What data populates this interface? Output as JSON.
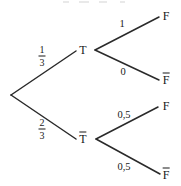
{
  "diagram": {
    "type": "probability-tree",
    "title": "",
    "width": 181,
    "height": 186,
    "line_color": "#2a2a2a",
    "text_color": "#181818"
  },
  "nodes": {
    "root": {
      "label": "",
      "x": 11,
      "y": 95
    },
    "t": {
      "label": "T",
      "x": 83,
      "y": 50
    },
    "t_bar": {
      "label": "T",
      "overbar": true,
      "x": 83,
      "y": 137
    },
    "leaf1": {
      "label": "F",
      "overbar": false,
      "x": 166,
      "y": 16
    },
    "leaf2": {
      "label": "F",
      "overbar": true,
      "x": 166,
      "y": 78
    },
    "leaf3": {
      "label": "F",
      "overbar": false,
      "x": 166,
      "y": 106
    },
    "leaf4": {
      "label": "F",
      "overbar": true,
      "x": 166,
      "y": 173
    }
  },
  "branch_labels": {
    "root_to_t": {
      "numerator": "1",
      "denominator": "3",
      "x": 42,
      "y": 56
    },
    "root_to_tbar": {
      "numerator": "2",
      "denominator": "3",
      "x": 42,
      "y": 129
    },
    "t_to_f": {
      "value": "1",
      "x": 122,
      "y": 24
    },
    "t_to_fbar": {
      "value": "0",
      "x": 123,
      "y": 72
    },
    "tbar_to_f": {
      "value": "0,5",
      "x": 124,
      "y": 115
    },
    "tbar_to_fbar": {
      "value": "0,5",
      "x": 124,
      "y": 167
    }
  },
  "edges": [
    {
      "name": "root-to-t",
      "x1": 11,
      "y1": 95,
      "x2": 76,
      "y2": 51
    },
    {
      "name": "root-to-tbar",
      "x1": 11,
      "y1": 95,
      "x2": 76,
      "y2": 139
    },
    {
      "name": "t-to-f",
      "x1": 95,
      "y1": 50,
      "x2": 159,
      "y2": 17
    },
    {
      "name": "t-to-fbar",
      "x1": 95,
      "y1": 50,
      "x2": 159,
      "y2": 80
    },
    {
      "name": "tbar-to-f",
      "x1": 96,
      "y1": 139,
      "x2": 158,
      "y2": 107
    },
    {
      "name": "tbar-to-fbar",
      "x1": 96,
      "y1": 139,
      "x2": 160,
      "y2": 174
    }
  ]
}
